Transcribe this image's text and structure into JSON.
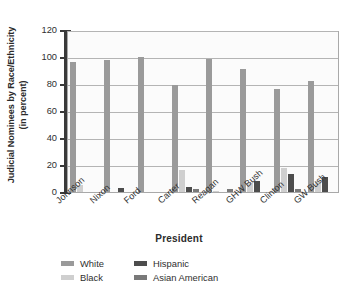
{
  "chart_data": {
    "type": "bar",
    "title": "",
    "xlabel": "President",
    "ylabel": "Judicial Nominees by Race/Ethnicity (in percent)",
    "ylabel_line1": "Judicial Nominees by Race/Ethnicity",
    "ylabel_line2": "(in percent)",
    "categories": [
      "Johnson",
      "Nixon",
      "Ford",
      "Carter",
      "Reagan",
      "GHW Bush",
      "Clinton",
      "GW Bush"
    ],
    "ylim": [
      0,
      120
    ],
    "yticks": [
      0,
      20,
      40,
      60,
      80,
      100,
      120
    ],
    "ytick_labels": [
      "0",
      "20",
      "40",
      "60",
      "80",
      "100",
      "120"
    ],
    "grid": true,
    "legend_position": "bottom",
    "series": [
      {
        "name": "White",
        "color": "#9a9a9a",
        "values": [
          96,
          98,
          100,
          79,
          98.5,
          91,
          76,
          82
        ]
      },
      {
        "name": "Black",
        "color": "#cfcfcf",
        "values": [
          5,
          0,
          0,
          16,
          0.5,
          7,
          17.5,
          8
        ]
      },
      {
        "name": "Hispanic",
        "color": "#4d4d4d",
        "values": [
          0,
          3,
          0,
          4,
          0,
          8,
          13,
          11
        ]
      },
      {
        "name": "Asian American",
        "color": "#797979",
        "values": [
          0,
          0,
          0,
          2.5,
          2,
          0,
          2.5,
          0
        ]
      }
    ],
    "legend": [
      {
        "label": "White",
        "color": "#9a9a9a"
      },
      {
        "label": "Hispanic",
        "color": "#4d4d4d"
      },
      {
        "label": "Black",
        "color": "#cfcfcf"
      },
      {
        "label": "Asian American",
        "color": "#797979"
      }
    ]
  }
}
